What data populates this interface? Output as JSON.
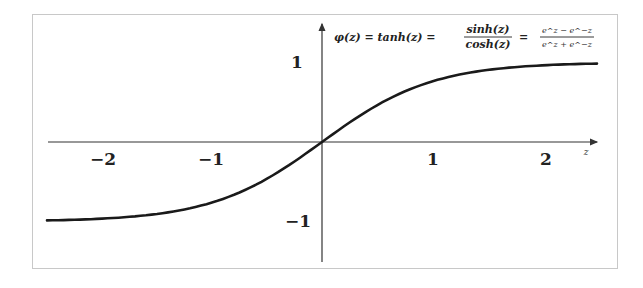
{
  "chart_data": {
    "type": "line",
    "xlabel": "z",
    "ylabel": "",
    "xlim": [
      -2.5,
      2.5
    ],
    "ylim": [
      -1.2,
      1.35
    ],
    "grid": false,
    "legend": null,
    "x_ticks": [
      -2,
      -1,
      1,
      2
    ],
    "y_ticks": [
      1,
      -1
    ],
    "x_tick_labels": [
      "−2",
      "−1",
      "1",
      "2"
    ],
    "y_tick_labels": [
      "1",
      "−1"
    ],
    "series": [
      {
        "name": "tanh(z)",
        "x": [
          -2.5,
          -2.0,
          -1.5,
          -1.0,
          -0.75,
          -0.5,
          -0.25,
          0.0,
          0.25,
          0.5,
          0.75,
          1.0,
          1.5,
          2.0,
          2.5
        ],
        "values": [
          -0.987,
          -0.964,
          -0.905,
          -0.762,
          -0.635,
          -0.462,
          -0.245,
          0.0,
          0.245,
          0.462,
          0.635,
          0.762,
          0.905,
          0.964,
          0.987
        ]
      }
    ]
  },
  "labels": {
    "x_axis_var": "z",
    "tick_neg2": "−2",
    "tick_neg1": "−1",
    "tick_pos1": "1",
    "tick_pos2": "2",
    "ytick_pos1": "1",
    "ytick_neg1": "−1",
    "formula_lhs": "φ(z) = tanh(z) =",
    "formula_frac1_num": "sinh(z)",
    "formula_frac1_den": "cosh(z)",
    "formula_eq": "=",
    "formula_frac2_num": "e^z − e^−z",
    "formula_frac2_den": "e^z + e^−z"
  },
  "colors": {
    "curve": "#1a1a1a",
    "axis": "#333333",
    "frame": "#c8c8c8"
  }
}
